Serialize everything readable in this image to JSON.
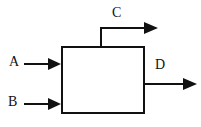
{
  "diagram": {
    "type": "process-block-diagram",
    "canvas": {
      "width": 201,
      "height": 127,
      "background": "#ffffff"
    },
    "stroke_color": "#111111",
    "stroke_width": 2,
    "block": {
      "name": "process-block",
      "x": 61,
      "y": 46,
      "width": 83,
      "height": 67,
      "fill": "#ffffff",
      "label": ""
    },
    "streams": [
      {
        "id": "A",
        "label": "A",
        "direction": "inlet",
        "orientation": "horizontal",
        "side": "left",
        "line_start": [
          24,
          64
        ],
        "line_end": [
          61,
          64
        ],
        "arrow_tip": [
          61,
          64
        ],
        "label_position": [
          9,
          55
        ]
      },
      {
        "id": "B",
        "label": "B",
        "direction": "inlet",
        "orientation": "horizontal",
        "side": "left",
        "line_start": [
          24,
          104
        ],
        "line_end": [
          61,
          104
        ],
        "arrow_tip": [
          61,
          104
        ],
        "label_position": [
          8,
          95
        ]
      },
      {
        "id": "C",
        "label": "C",
        "direction": "outlet",
        "orientation": "elbow-up-right",
        "side": "top",
        "line_start": [
          101,
          46
        ],
        "elbow": [
          101,
          28
        ],
        "line_end": [
          157,
          28
        ],
        "arrow_tip": [
          157,
          28
        ],
        "label_position": [
          112,
          6
        ]
      },
      {
        "id": "D",
        "label": "D",
        "direction": "outlet",
        "orientation": "horizontal",
        "side": "right",
        "line_start": [
          144,
          84
        ],
        "line_end": [
          196,
          84
        ],
        "arrow_tip": [
          196,
          84
        ],
        "label_position": [
          155,
          58
        ]
      }
    ]
  }
}
